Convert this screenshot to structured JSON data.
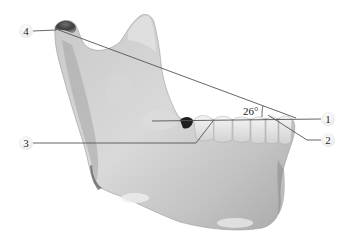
{
  "diagram": {
    "angle_label": "26°",
    "labels": [
      {
        "id": "1",
        "text": "1",
        "x": 328,
        "y": 119
      },
      {
        "id": "2",
        "text": "2",
        "x": 328,
        "y": 140
      },
      {
        "id": "3",
        "text": "3",
        "x": 26,
        "y": 143
      },
      {
        "id": "4",
        "text": "4",
        "x": 26,
        "y": 31
      }
    ],
    "colors": {
      "bone_light": "#e6e6e6",
      "bone_mid": "#bdbdbd",
      "bone_dark": "#8a8a8a",
      "line": "#555555",
      "background": "#ffffff"
    }
  }
}
